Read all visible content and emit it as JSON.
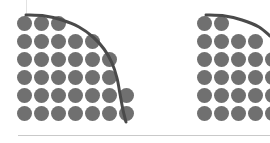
{
  "figure": {
    "width": 270,
    "height": 143,
    "background": "#ffffff",
    "dot_color": "#707070",
    "curve_color": "#4a4a4a",
    "rule_color": "#c9c9c9",
    "guide_color": "#e2e2e2",
    "dot_radius": 7.5,
    "curve_width": 3
  },
  "axis_rule": {
    "x": 18,
    "y": 135,
    "width": 252,
    "color": "#c9c9c9"
  },
  "guide_line": {
    "x": 26,
    "y": 0,
    "height": 14,
    "color": "#e2e2e2"
  },
  "chart_data": [
    {
      "id": "left-waffle-arc",
      "type": "scatter",
      "title": "",
      "subtitle": "",
      "xlabel": "",
      "ylabel": "",
      "grid": false,
      "legend": null,
      "annotations": [],
      "xlim": [
        0,
        7
      ],
      "ylim": [
        0,
        6
      ],
      "columns": 7,
      "rows": 6,
      "col_x": [
        24,
        41,
        58,
        75,
        92,
        109,
        126
      ],
      "row_y": [
        23,
        41,
        59,
        77,
        95,
        113
      ],
      "row_counts": [
        3,
        5,
        6,
        6,
        7,
        7
      ],
      "total_dots": 34,
      "curve": {
        "name": "arc",
        "points": [
          [
            26,
            15
          ],
          [
            45,
            16
          ],
          [
            62,
            20
          ],
          [
            79,
            27
          ],
          [
            93,
            37
          ],
          [
            104,
            49
          ],
          [
            112,
            63
          ],
          [
            117,
            78
          ],
          [
            120,
            94
          ],
          [
            123,
            110
          ],
          [
            126,
            122
          ]
        ]
      }
    },
    {
      "id": "right-waffle-arc",
      "type": "scatter",
      "title": "",
      "subtitle": "",
      "xlabel": "",
      "ylabel": "",
      "grid": false,
      "legend": null,
      "annotations": [],
      "xlim": [
        0,
        7
      ],
      "ylim": [
        0,
        6
      ],
      "columns": 5,
      "rows": 6,
      "clipped_right": true,
      "col_x": [
        204,
        221,
        238,
        255,
        272
      ],
      "row_y": [
        23,
        41,
        59,
        77,
        95,
        113
      ],
      "row_counts": [
        2,
        4,
        5,
        5,
        5,
        5
      ],
      "total_dots": 26,
      "curve": {
        "name": "arc",
        "points": [
          [
            206,
            15
          ],
          [
            225,
            16
          ],
          [
            242,
            20
          ],
          [
            259,
            27
          ],
          [
            270,
            36
          ]
        ]
      }
    }
  ]
}
